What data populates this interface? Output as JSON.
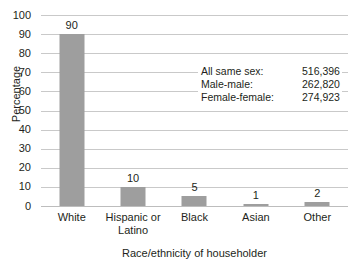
{
  "chart_data": {
    "type": "bar",
    "title": "",
    "xlabel": "Race/ethnicity of householder",
    "ylabel": "Percentage",
    "ylim": [
      0,
      100
    ],
    "ytick_step": 10,
    "grid": true,
    "legend": "none",
    "bar_color": "#9e9e9e",
    "categories": [
      "White",
      "Hispanic or Latino",
      "Black",
      "Asian",
      "Other"
    ],
    "category_lines": [
      [
        "White"
      ],
      [
        "Hispanic or",
        "Latino"
      ],
      [
        "Black"
      ],
      [
        "Asian"
      ],
      [
        "Other"
      ]
    ],
    "values": [
      90,
      10,
      5,
      1,
      2
    ],
    "value_labels": [
      "90",
      "10",
      "5",
      "1",
      "2"
    ],
    "yticks": [
      "0",
      "10",
      "20",
      "30",
      "40",
      "50",
      "60",
      "70",
      "80",
      "90",
      "100"
    ],
    "annotations": [
      {
        "label": "All same sex:",
        "value": "516,396"
      },
      {
        "label": "Male-male:",
        "value": "262,820"
      },
      {
        "label": "Female-female:",
        "value": "274,923"
      }
    ]
  }
}
